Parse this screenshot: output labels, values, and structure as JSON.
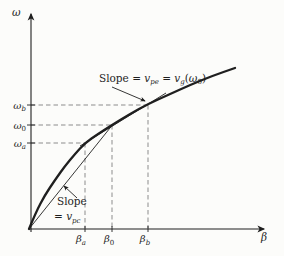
{
  "figure": {
    "type": "omega-beta-dispersion-diagram",
    "background": "#fcfcfa",
    "ink_color": "#1f1f1f",
    "guide_color": "#8c8c8c",
    "axes": {
      "y_label": "ω",
      "x_label": "β"
    },
    "y_ticks": [
      {
        "base": "ω",
        "sub": "b"
      },
      {
        "base": "ω",
        "sub": "0"
      },
      {
        "base": "ω",
        "sub": "a"
      }
    ],
    "x_ticks": [
      {
        "base": "β",
        "sub": "a"
      },
      {
        "base": "β",
        "sub": "0"
      },
      {
        "base": "β",
        "sub": "b"
      }
    ],
    "annotations": {
      "envelope": {
        "prefix": "Slope = ",
        "v1": "v",
        "sub1": "pe",
        "eq": " = ",
        "v2": "v",
        "sub2": "g",
        "open": "(",
        "omega": "ω",
        "sub3": "0",
        "close": ")"
      },
      "carrier": {
        "line1": "Slope",
        "eq": "= ",
        "v": "v",
        "sub": "pc"
      }
    },
    "geometry": {
      "x_axis": [
        29,
        229,
        264,
        229
      ],
      "y_axis": [
        31,
        232,
        31,
        14
      ],
      "curve": [
        [
          29,
          229
        ],
        [
          36,
          212
        ],
        [
          45,
          195
        ],
        [
          55,
          180
        ],
        [
          65,
          166
        ],
        [
          75,
          154
        ],
        [
          85,
          143
        ],
        [
          98,
          134
        ],
        [
          112,
          125
        ],
        [
          130,
          114
        ],
        [
          148,
          104
        ],
        [
          168,
          95
        ],
        [
          190,
          85
        ],
        [
          212,
          76
        ],
        [
          235,
          68
        ]
      ],
      "carrier_line": [
        29,
        229,
        114,
        123
      ],
      "envelope_line": [
        80,
        146,
        166,
        93
      ],
      "h_guides": [
        [
          31,
          105,
          148
        ],
        [
          31,
          125,
          112
        ],
        [
          31,
          143,
          85
        ]
      ],
      "v_guides": [
        [
          85,
          143,
          228
        ],
        [
          112,
          125,
          228
        ],
        [
          148,
          105,
          228
        ]
      ],
      "y_tick_marks": [
        105,
        125,
        143
      ],
      "x_tick_marks": [
        85,
        112,
        148
      ],
      "leader_envelope": [
        112,
        87,
        145,
        101
      ],
      "leader_carrier": [
        77,
        198,
        64,
        186
      ]
    }
  }
}
